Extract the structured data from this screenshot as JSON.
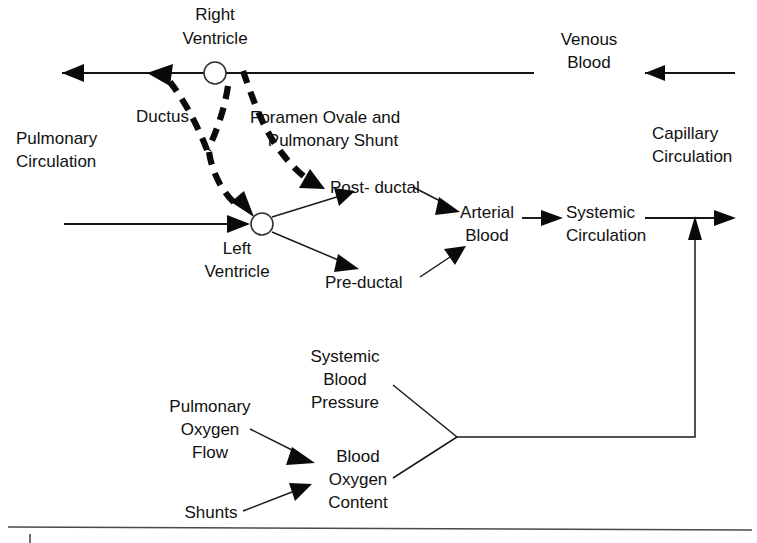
{
  "diagram": {
    "colors": {
      "ink": "#0a0a0a",
      "line": "#141414",
      "rule": "#4a4a4a",
      "background": "#ffffff"
    },
    "labels": {
      "right_ventricle": {
        "line1": "Right",
        "line2": "Ventricle"
      },
      "left_ventricle": {
        "line1": "Left",
        "line2": "Ventricle"
      },
      "pulmonary_circulation": {
        "line1": "Pulmonary",
        "line2": "Circulation"
      },
      "ductus": "Ductus",
      "foramen_ovale": {
        "line1": "Foramen Ovale and",
        "line2": "Pulmonary Shunt"
      },
      "post_ductal": "Post- ductal",
      "pre_ductal": "Pre-ductal",
      "venous_blood": {
        "line1": "Venous",
        "line2": "Blood"
      },
      "capillary_circulation": {
        "line1": "Capillary",
        "line2": "Circulation"
      },
      "arterial_blood": {
        "line1": "Arterial",
        "line2": "Blood"
      },
      "systemic_circulation": {
        "line1": "Systemic",
        "line2": "Circulation"
      },
      "systemic_blood_pressure": {
        "line1": "Systemic",
        "line2": "Blood",
        "line3": "Pressure"
      },
      "pulmonary_oxygen_flow": {
        "line1": "Pulmonary",
        "line2": "Oxygen",
        "line3": "Flow"
      },
      "blood_oxygen_content": {
        "line1": "Blood",
        "line2": "Oxygen",
        "line3": "Content"
      },
      "shunts": "Shunts"
    },
    "nodes": [
      {
        "id": "right-ventricle",
        "shape": "circle",
        "cx": 215,
        "cy": 73,
        "r": 11
      },
      {
        "id": "left-ventricle",
        "shape": "circle",
        "cx": 262,
        "cy": 224,
        "r": 11
      }
    ],
    "edges": [
      {
        "id": "venous-inflow",
        "style": "solid",
        "from": "far-right",
        "to": "venous-blood"
      },
      {
        "id": "venous-to-right-ventricle",
        "style": "solid",
        "from": "venous-blood",
        "to": "right-ventricle"
      },
      {
        "id": "right-ventricle-to-pulmonary",
        "style": "solid",
        "from": "right-ventricle",
        "to": "pulmonary-circulation"
      },
      {
        "id": "ductus-shunt",
        "style": "dashed",
        "from": "right-ventricle-line",
        "to": "pulmonary-arrow"
      },
      {
        "id": "foramen-ovale-shunt",
        "style": "dashed",
        "from": "right-ventricle",
        "to": "post-ductal"
      },
      {
        "id": "foramen-ovale-to-left-ventricle",
        "style": "dashed",
        "from": "right-ventricle",
        "to": "left-ventricle"
      },
      {
        "id": "pulmonary-to-left-ventricle",
        "style": "solid",
        "from": "pulmonary-circulation",
        "to": "left-ventricle"
      },
      {
        "id": "left-ventricle-to-post-ductal",
        "style": "thin",
        "from": "left-ventricle",
        "to": "post-ductal"
      },
      {
        "id": "left-ventricle-to-pre-ductal",
        "style": "thin",
        "from": "left-ventricle",
        "to": "pre-ductal"
      },
      {
        "id": "post-ductal-to-arterial",
        "style": "thin",
        "from": "post-ductal",
        "to": "arterial-blood"
      },
      {
        "id": "pre-ductal-to-arterial",
        "style": "thin",
        "from": "pre-ductal",
        "to": "arterial-blood"
      },
      {
        "id": "arterial-to-systemic",
        "style": "solid",
        "from": "arterial-blood",
        "to": "systemic-circulation"
      },
      {
        "id": "systemic-outflow",
        "style": "solid",
        "from": "systemic-circulation",
        "to": "far-right"
      },
      {
        "id": "oxygen-flow-to-content",
        "style": "thin",
        "from": "pulmonary-oxygen-flow",
        "to": "blood-oxygen-content"
      },
      {
        "id": "shunts-to-content",
        "style": "thin",
        "from": "shunts",
        "to": "blood-oxygen-content"
      },
      {
        "id": "pressure-junction",
        "style": "thin",
        "from": "systemic-blood-pressure",
        "to": "junction"
      },
      {
        "id": "content-junction",
        "style": "thin",
        "from": "blood-oxygen-content",
        "to": "junction"
      },
      {
        "id": "feedback-loop",
        "style": "thin",
        "from": "junction",
        "to": "systemic-outflow"
      }
    ],
    "footer_rule": {
      "y": 528
    }
  }
}
